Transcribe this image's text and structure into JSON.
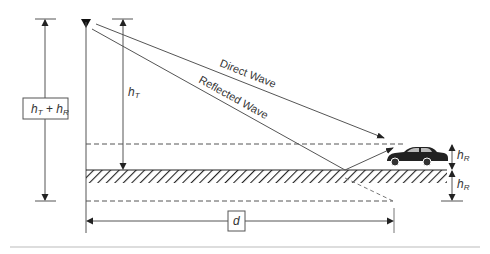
{
  "diagram": {
    "labels": {
      "total_height": {
        "main": "h",
        "sub1": "T",
        "plus": " + ",
        "main2": "h",
        "sub2": "R"
      },
      "transmitter_height": {
        "main": "h",
        "sub": "T"
      },
      "receiver_height_above": {
        "main": "h",
        "sub": "R"
      },
      "receiver_height_below": {
        "main": "h",
        "sub": "R"
      },
      "distance": "d",
      "direct_wave": "Direct Wave",
      "reflected_wave": "Reflected Wave"
    },
    "elements": {
      "transmitter": "antenna-triangle-icon",
      "receiver": "car-icon",
      "ground": "hatched-ground"
    },
    "colors": {
      "line": "#555555",
      "text": "#333333",
      "car": "#222222",
      "background": "#ffffff"
    }
  }
}
